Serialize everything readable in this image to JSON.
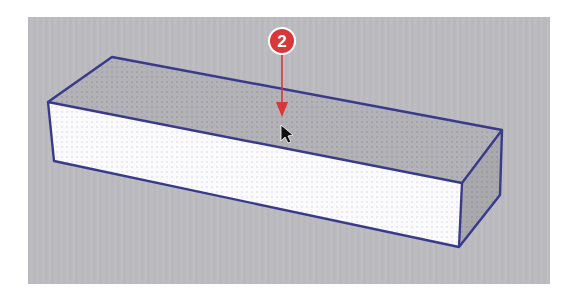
{
  "viewport": {
    "background": "#b9b8bc",
    "panel": {
      "x": 28,
      "y": 17,
      "width": 522,
      "height": 267
    }
  },
  "model": {
    "shape": "box",
    "edge_color": "#3a3a8c",
    "faces": {
      "top": {
        "fill": "#b3b2b6",
        "state": "hover-highlight"
      },
      "front": {
        "fill": "#fbfbfd"
      },
      "side": {
        "fill": "#a9a8ac"
      }
    }
  },
  "callout": {
    "number": "2",
    "color": "#d9383a",
    "border_color": "#ffffff",
    "text_color": "#ffffff"
  },
  "cursor": {
    "icon": "arrow-pointer-icon"
  }
}
